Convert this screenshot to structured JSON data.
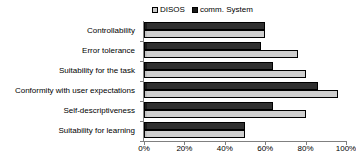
{
  "chart_data": {
    "type": "bar",
    "orientation": "horizontal",
    "title": "",
    "subtitle": "",
    "xlabel": "",
    "ylabel": "",
    "xlim": [
      0,
      100
    ],
    "xtick_labels": [
      "0%",
      "20%",
      "40%",
      "60%",
      "80%",
      "100%"
    ],
    "xtick_values": [
      0,
      20,
      40,
      60,
      80,
      100
    ],
    "grid": false,
    "legend_position": "top-center",
    "categories": [
      "Controllability",
      "Error tolerance",
      "Suitability for the task",
      "Conformity with user expectations",
      "Self-descriptiveness",
      "Suitability for learning"
    ],
    "series": [
      {
        "name": "DISOS",
        "color": "#c9c9c9",
        "values": [
          60,
          76,
          80,
          96,
          80,
          50
        ]
      },
      {
        "name": "comm. System",
        "color": "#1c1c1c",
        "values": [
          60,
          58,
          64,
          86,
          64,
          50
        ]
      }
    ]
  },
  "legend": {
    "entries": [
      {
        "label": "DISOS",
        "swatch": "light-square-icon"
      },
      {
        "label": "comm. System",
        "swatch": "dark-square-icon"
      }
    ]
  }
}
